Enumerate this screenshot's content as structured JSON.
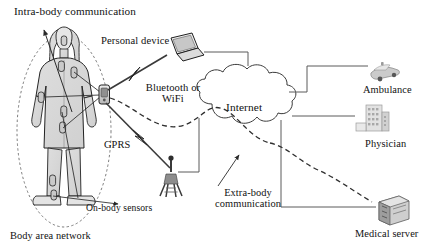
{
  "diagram": {
    "background": "#ffffff",
    "line_color": "#555555",
    "figure_fill": "#d9d9d9",
    "stroke": "#222222"
  },
  "labels": {
    "intra_body": "Intra-body communication",
    "personal_device": "Personal device",
    "bluetooth_wifi": "Bluetooth or\nWiFi",
    "gprs": "GPRS",
    "on_body_sensors": "On-body sensors",
    "body_area_network": "Body area network",
    "internet": "Internet",
    "extra_body": "Extra-body\ncommunication",
    "ambulance": "Ambulance",
    "physician": "Physician",
    "medical_server": "Medical server"
  },
  "nodes": [
    {
      "name": "patient-figure",
      "label": "Body area network",
      "kind": "human-with-sensors"
    },
    {
      "name": "body-hub",
      "label": "Bluetooth or WiFi",
      "kind": "gateway-device"
    },
    {
      "name": "laptop",
      "label": "Personal device",
      "kind": "laptop"
    },
    {
      "name": "cell-tower",
      "label": "GPRS",
      "kind": "base-station"
    },
    {
      "name": "internet-cloud",
      "label": "Internet",
      "kind": "cloud"
    },
    {
      "name": "ambulance",
      "label": "Ambulance",
      "kind": "vehicle"
    },
    {
      "name": "physician",
      "label": "Physician",
      "kind": "building"
    },
    {
      "name": "medical-server",
      "label": "Medical server",
      "kind": "server"
    }
  ],
  "links": [
    {
      "from": "body-hub",
      "to": "laptop",
      "style": "lightning-wireless"
    },
    {
      "from": "body-hub",
      "to": "cell-tower",
      "style": "lightning-wireless"
    },
    {
      "from": "laptop",
      "to": "internet-cloud",
      "style": "solid"
    },
    {
      "from": "cell-tower",
      "to": "internet-cloud",
      "style": "solid"
    },
    {
      "from": "internet-cloud",
      "to": "ambulance",
      "style": "solid"
    },
    {
      "from": "internet-cloud",
      "to": "physician",
      "style": "solid"
    },
    {
      "from": "internet-cloud",
      "to": "medical-server",
      "style": "solid"
    },
    {
      "from": "body-hub",
      "to": "internet-cloud",
      "style": "dashed-extra-body"
    },
    {
      "from": "internet-cloud",
      "to": "medical-server",
      "style": "dashed-extra-body"
    }
  ],
  "sensor_count": 8
}
